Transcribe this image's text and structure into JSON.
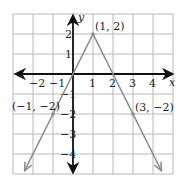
{
  "chart_data": {
    "type": "line",
    "title": "",
    "xlabel": "x",
    "ylabel": "y",
    "xlim": [
      -3,
      5
    ],
    "ylim": [
      -5,
      3
    ],
    "grid": true,
    "x_ticks": [
      -2,
      -1,
      1,
      2,
      3,
      4
    ],
    "y_ticks": [
      2,
      1,
      -1,
      -2,
      -3,
      -4
    ],
    "x_tick_labels": [
      "−2",
      "−1",
      "1",
      "2",
      "3",
      "4"
    ],
    "y_tick_labels": [
      "2",
      "1",
      "−1",
      "−2",
      "−3",
      "−4"
    ],
    "series": [
      {
        "name": "V-shaped graph",
        "x": [
          -2.4,
          -1,
          0,
          1,
          2,
          3,
          4.4
        ],
        "y": [
          -4.8,
          -2,
          0,
          2,
          0,
          -2,
          -4.8
        ],
        "color": "#8c8c8c",
        "arrows_at_ends": true
      }
    ],
    "labeled_points": [
      {
        "x": 1,
        "y": 2,
        "label": "(1, 2)"
      },
      {
        "x": -1,
        "y": -2,
        "label": "(−1, −2)"
      },
      {
        "x": 3,
        "y": -2,
        "label": "(3, −2)"
      }
    ],
    "colors": {
      "grid": "#b8b8b8",
      "axes": "#111111",
      "line": "#8c8c8c",
      "text": "#222222"
    }
  }
}
